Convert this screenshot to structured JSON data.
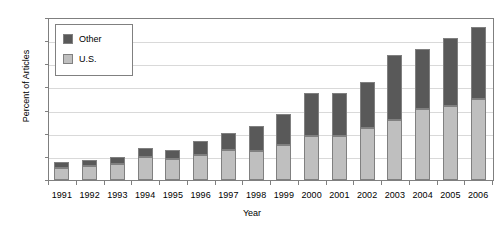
{
  "chart_data": {
    "type": "bar",
    "stacked": true,
    "title": "",
    "xlabel": "Year",
    "ylabel": "Percent of Articles",
    "ylim": [
      0,
      7
    ],
    "ytick_step": 1,
    "yticks": [
      0,
      1,
      2,
      3,
      4,
      5,
      6,
      7
    ],
    "grid": true,
    "grid_axis": "y",
    "legend_position": "upper-left-inside",
    "categories": [
      "1991",
      "1992",
      "1993",
      "1994",
      "1995",
      "1996",
      "1997",
      "1998",
      "1999",
      "2000",
      "2001",
      "2002",
      "2003",
      "2004",
      "2005",
      "2006"
    ],
    "series": [
      {
        "name": "U.S.",
        "color": "#bfbfbf",
        "values": [
          0.5,
          0.6,
          0.7,
          1.0,
          0.9,
          1.1,
          1.3,
          1.25,
          1.5,
          1.9,
          1.9,
          2.25,
          2.6,
          3.05,
          3.2,
          3.5
        ]
      },
      {
        "name": "Other",
        "color": "#595959",
        "values": [
          0.3,
          0.25,
          0.3,
          0.4,
          0.4,
          0.6,
          0.75,
          1.1,
          1.35,
          1.85,
          1.85,
          2.0,
          2.8,
          2.6,
          2.95,
          3.1
        ]
      }
    ],
    "totals": [
      0.8,
      0.85,
      1.0,
      1.4,
      1.3,
      1.7,
      2.05,
      2.35,
      2.85,
      3.75,
      3.75,
      4.25,
      5.4,
      5.65,
      6.15,
      6.6
    ]
  },
  "legend": {
    "items": [
      {
        "label": "Other",
        "color": "#595959"
      },
      {
        "label": "U.S.",
        "color": "#bfbfbf"
      }
    ]
  }
}
